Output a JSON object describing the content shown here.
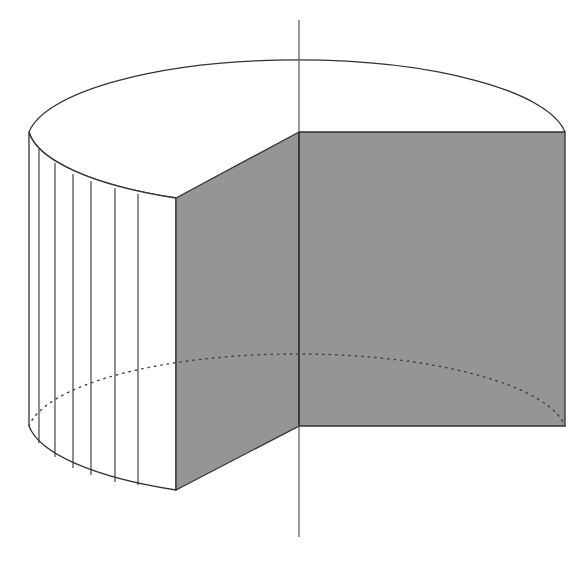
{
  "diagram": {
    "title": "",
    "colors": {
      "background": "#ffffff",
      "stroke": "#333333",
      "cut_face": "#959595",
      "axis": "#555555",
      "hidden_edge": "#555555"
    },
    "geometry": {
      "axis": {
        "x": 299,
        "y_top": 20,
        "y_bottom": 537
      },
      "top_ellipse": {
        "cx": 299,
        "cy": 132,
        "rx": 270,
        "ry": 82
      },
      "bottom_ellipse": {
        "cx": 299,
        "cy": 426,
        "rx": 270,
        "ry": 82
      },
      "height": 294,
      "front_corner": {
        "x": 176,
        "y_top": 198,
        "y_bottom": 490
      },
      "right_face_edge_x": 565,
      "left_edge_x": 29,
      "stripe_x": [
        39,
        55,
        73,
        91,
        115,
        138
      ]
    }
  }
}
